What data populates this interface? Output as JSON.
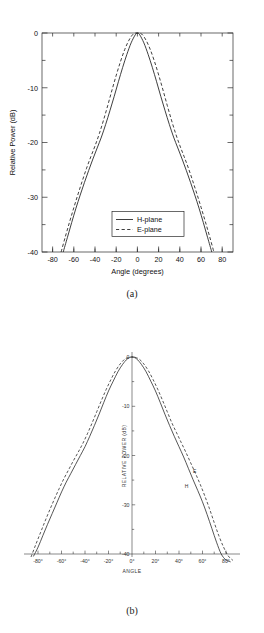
{
  "page": {
    "background": "#ffffff",
    "ink": "#1a1a1a"
  },
  "figures": [
    {
      "id": "a",
      "caption": "(a)",
      "chart_ref": 0
    },
    {
      "id": "b",
      "caption": "(b)",
      "chart_ref": 1
    }
  ],
  "chart_data": [
    {
      "type": "line",
      "title": "",
      "style": "modern-boxed-axes",
      "xlabel": "Angle (degrees)",
      "ylabel": "Relative Power (dB)",
      "xlim": [
        -90,
        90
      ],
      "ylim": [
        -40,
        0
      ],
      "xticks": [
        -80,
        -60,
        -40,
        -20,
        0,
        20,
        40,
        60,
        80
      ],
      "xticklabels": [
        "-80",
        "-60",
        "-40",
        "-20",
        "0",
        "20",
        "40",
        "60",
        "80"
      ],
      "yticks": [
        0,
        -10,
        -20,
        -30,
        -40
      ],
      "yticklabels": [
        "0",
        "-10",
        "-20",
        "-30",
        "-40"
      ],
      "minor_xtick_step": 10,
      "minor_ytick_step": 5,
      "grid": false,
      "legend": {
        "position": "lower-center-right",
        "entries": [
          {
            "label": "H-plane",
            "style": "solid"
          },
          {
            "label": "E-plane",
            "style": "dashed"
          }
        ]
      },
      "series": [
        {
          "name": "H-plane",
          "style": "solid",
          "x": [
            -70,
            -66,
            -62,
            -58,
            -54,
            -50,
            -46,
            -42,
            -38,
            -34,
            -30,
            -26,
            -22,
            -18,
            -14,
            -10,
            -6,
            -2,
            0,
            2,
            6,
            10,
            14,
            18,
            22,
            26,
            30,
            34,
            38,
            42,
            46,
            50,
            54,
            58,
            62,
            66,
            70
          ],
          "y": [
            -40.0,
            -37.3,
            -34.6,
            -32.0,
            -29.6,
            -27.3,
            -25.1,
            -23.0,
            -21.0,
            -19.0,
            -16.7,
            -14.2,
            -11.6,
            -8.9,
            -6.3,
            -3.9,
            -1.8,
            -0.3,
            0.0,
            -0.3,
            -1.8,
            -3.9,
            -6.3,
            -8.9,
            -11.6,
            -14.2,
            -16.7,
            -19.0,
            -21.0,
            -23.0,
            -25.1,
            -27.3,
            -29.6,
            -32.0,
            -34.6,
            -37.3,
            -40.0
          ]
        },
        {
          "name": "E-plane",
          "style": "dashed",
          "x": [
            -72,
            -68,
            -64,
            -60,
            -56,
            -52,
            -48,
            -44,
            -40,
            -36,
            -32,
            -28,
            -24,
            -20,
            -16,
            -12,
            -8,
            -4,
            0,
            4,
            8,
            12,
            16,
            20,
            24,
            28,
            32,
            36,
            40,
            44,
            48,
            52,
            56,
            60,
            64,
            68,
            72
          ],
          "y": [
            -40.0,
            -37.2,
            -34.5,
            -31.9,
            -29.4,
            -27.0,
            -24.7,
            -22.6,
            -20.6,
            -18.4,
            -15.9,
            -13.2,
            -10.4,
            -7.7,
            -5.2,
            -3.0,
            -1.3,
            -0.2,
            0.0,
            -0.2,
            -1.3,
            -3.0,
            -5.2,
            -7.7,
            -10.4,
            -13.2,
            -15.9,
            -18.4,
            -20.6,
            -22.6,
            -24.7,
            -27.0,
            -29.4,
            -31.9,
            -34.5,
            -37.2,
            -40.0
          ]
        }
      ]
    },
    {
      "type": "line",
      "title": "",
      "style": "scanned-centered-axes",
      "xlabel": "ANGLE",
      "ylabel": "RELATIVE POWER (dB)",
      "xlim": [
        -90,
        90
      ],
      "ylim": [
        -40,
        0
      ],
      "xticks": [
        -80,
        -70,
        -60,
        -50,
        -40,
        -30,
        -20,
        -10,
        0,
        10,
        20,
        30,
        40,
        50,
        60,
        70,
        80
      ],
      "xticklabels": [
        "-80°",
        "-60°",
        "-40°",
        "-20°",
        "0°",
        "20°",
        "40°",
        "60°",
        "80°"
      ],
      "major_xticks": [
        -80,
        -60,
        -40,
        -20,
        0,
        20,
        40,
        60,
        80
      ],
      "yticks": [
        0,
        -10,
        -20,
        -30,
        -40
      ],
      "yticklabels": [
        "0",
        "-10",
        "-20",
        "-30",
        "-40"
      ],
      "grid": false,
      "annotations": [
        {
          "text": "E",
          "x": 52,
          "y": -23.5
        },
        {
          "text": "H",
          "x": 45,
          "y": -26.5
        }
      ],
      "series": [
        {
          "name": "H",
          "style": "solid",
          "x": [
            -84,
            -80,
            -76,
            -72,
            -68,
            -64,
            -60,
            -56,
            -52,
            -48,
            -44,
            -40,
            -36,
            -32,
            -28,
            -24,
            -20,
            -16,
            -12,
            -8,
            -4,
            0,
            4,
            8,
            12,
            16,
            20,
            24,
            28,
            32,
            36,
            40,
            44,
            48,
            52,
            56,
            60,
            64,
            68,
            72,
            76,
            80,
            84
          ],
          "y": [
            -40.5,
            -38.6,
            -36.3,
            -34.0,
            -31.8,
            -29.6,
            -27.4,
            -25.4,
            -23.6,
            -21.8,
            -20.0,
            -18.2,
            -16.1,
            -13.9,
            -11.6,
            -9.2,
            -6.9,
            -4.9,
            -3.0,
            -1.5,
            -0.4,
            0.0,
            -0.4,
            -1.5,
            -3.0,
            -4.9,
            -6.9,
            -9.2,
            -11.6,
            -13.9,
            -16.1,
            -18.2,
            -20.3,
            -22.6,
            -24.9,
            -27.1,
            -29.4,
            -32.0,
            -34.8,
            -37.6,
            -40.0,
            -41.2,
            -41.6
          ]
        },
        {
          "name": "E",
          "style": "dashed",
          "x": [
            -86,
            -82,
            -78,
            -74,
            -70,
            -66,
            -62,
            -58,
            -54,
            -50,
            -46,
            -42,
            -38,
            -34,
            -30,
            -26,
            -22,
            -18,
            -14,
            -10,
            -6,
            -2,
            0,
            2,
            6,
            10,
            14,
            18,
            22,
            26,
            30,
            34,
            38,
            42,
            46,
            50,
            54,
            58,
            62,
            66,
            70,
            74,
            78,
            82,
            86
          ],
          "y": [
            -40.6,
            -38.1,
            -35.7,
            -33.3,
            -31.0,
            -28.8,
            -26.7,
            -24.7,
            -22.9,
            -21.1,
            -19.4,
            -17.6,
            -15.6,
            -13.4,
            -11.1,
            -8.8,
            -6.6,
            -4.6,
            -2.8,
            -1.4,
            -0.4,
            -0.05,
            0.0,
            -0.05,
            -0.4,
            -1.4,
            -2.8,
            -4.6,
            -6.6,
            -8.8,
            -11.1,
            -13.4,
            -15.4,
            -17.4,
            -19.4,
            -21.5,
            -23.6,
            -25.8,
            -28.2,
            -30.8,
            -33.6,
            -36.3,
            -38.6,
            -40.4,
            -41.3
          ]
        }
      ]
    }
  ]
}
